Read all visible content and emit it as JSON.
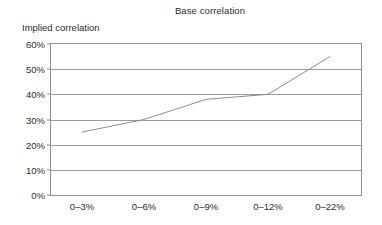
{
  "chart_data": {
    "type": "line",
    "title": "Base correlation",
    "xlabel": "",
    "ylabel": "Implied correlation",
    "categories": [
      "0–3%",
      "0–6%",
      "0–9%",
      "0–12%",
      "0–22%"
    ],
    "values": [
      25,
      30,
      38,
      40,
      55
    ],
    "series": [
      {
        "name": "Implied correlation",
        "values": [
          25,
          30,
          38,
          40,
          55
        ]
      }
    ],
    "ylim": [
      0,
      60
    ],
    "y_ticks": [
      0,
      10,
      20,
      30,
      40,
      50,
      60
    ],
    "y_tick_labels": [
      "0%",
      "10%",
      "20%",
      "30%",
      "40%",
      "50%",
      "60%"
    ],
    "grid": "horizontal",
    "legend": "none",
    "value_format": "percent",
    "colors": {
      "line": "#8c8c8c",
      "grid": "#9a9a9a",
      "frame": "#8f8f8f",
      "text": "#2b2b2b",
      "background": "#ffffff"
    }
  }
}
